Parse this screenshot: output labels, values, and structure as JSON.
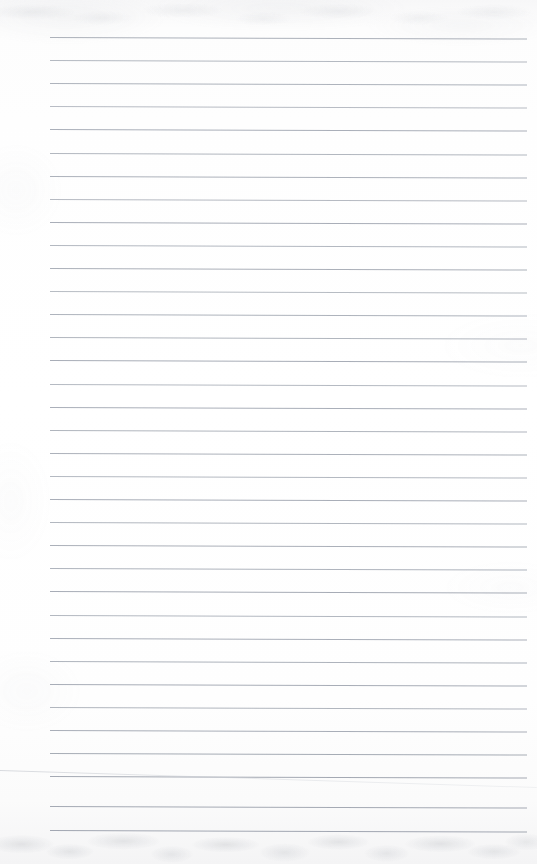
{
  "page": {
    "kind": "scanned-ruled-notebook-page",
    "width": 537,
    "height": 864,
    "has_handwriting": false,
    "has_printed_text": false,
    "visible_text": ""
  },
  "paper": {
    "background_color": "#fefefe",
    "top_tint_color": "#f7f7f8",
    "bottom_tint_color": "#f4f4f5",
    "mottle_color": "#969ba5"
  },
  "rules": {
    "line_color": "#9aa0ab",
    "line_thickness_px": 1,
    "line_count": 35,
    "first_line_y": 37,
    "spacing_px": 23.1,
    "left_x": 50,
    "right_x": 527,
    "tilt_drop_px": 1.5,
    "lines": [
      {
        "index": 1,
        "y": 37.0,
        "x1": 50,
        "x2": 527,
        "opacity": 0.82
      },
      {
        "index": 2,
        "y": 60.1,
        "x1": 50,
        "x2": 527,
        "opacity": 0.74
      },
      {
        "index": 3,
        "y": 83.2,
        "x1": 50,
        "x2": 527,
        "opacity": 0.8
      },
      {
        "index": 4,
        "y": 106.3,
        "x1": 50,
        "x2": 527,
        "opacity": 0.7
      },
      {
        "index": 5,
        "y": 129.4,
        "x1": 50,
        "x2": 527,
        "opacity": 0.84
      },
      {
        "index": 6,
        "y": 152.5,
        "x1": 50,
        "x2": 527,
        "opacity": 0.76
      },
      {
        "index": 7,
        "y": 175.6,
        "x1": 50,
        "x2": 527,
        "opacity": 0.81
      },
      {
        "index": 8,
        "y": 198.7,
        "x1": 50,
        "x2": 527,
        "opacity": 0.72
      },
      {
        "index": 9,
        "y": 221.8,
        "x1": 50,
        "x2": 527,
        "opacity": 0.85
      },
      {
        "index": 10,
        "y": 244.9,
        "x1": 50,
        "x2": 527,
        "opacity": 0.75
      },
      {
        "index": 11,
        "y": 268.0,
        "x1": 50,
        "x2": 527,
        "opacity": 0.83
      },
      {
        "index": 12,
        "y": 291.1,
        "x1": 50,
        "x2": 527,
        "opacity": 0.71
      },
      {
        "index": 13,
        "y": 314.2,
        "x1": 50,
        "x2": 527,
        "opacity": 0.8
      },
      {
        "index": 14,
        "y": 337.3,
        "x1": 50,
        "x2": 527,
        "opacity": 0.77
      },
      {
        "index": 15,
        "y": 360.4,
        "x1": 50,
        "x2": 527,
        "opacity": 0.86
      },
      {
        "index": 16,
        "y": 383.5,
        "x1": 50,
        "x2": 527,
        "opacity": 0.73
      },
      {
        "index": 17,
        "y": 406.6,
        "x1": 50,
        "x2": 527,
        "opacity": 0.84
      },
      {
        "index": 18,
        "y": 429.7,
        "x1": 50,
        "x2": 527,
        "opacity": 0.78
      },
      {
        "index": 19,
        "y": 452.8,
        "x1": 50,
        "x2": 527,
        "opacity": 0.82
      },
      {
        "index": 20,
        "y": 475.9,
        "x1": 50,
        "x2": 527,
        "opacity": 0.74
      },
      {
        "index": 21,
        "y": 499.0,
        "x1": 50,
        "x2": 527,
        "opacity": 0.85
      },
      {
        "index": 22,
        "y": 522.1,
        "x1": 50,
        "x2": 527,
        "opacity": 0.76
      },
      {
        "index": 23,
        "y": 545.2,
        "x1": 50,
        "x2": 527,
        "opacity": 0.83
      },
      {
        "index": 24,
        "y": 568.3,
        "x1": 50,
        "x2": 527,
        "opacity": 0.79
      },
      {
        "index": 25,
        "y": 591.4,
        "x1": 50,
        "x2": 527,
        "opacity": 0.87
      },
      {
        "index": 26,
        "y": 614.5,
        "x1": 50,
        "x2": 527,
        "opacity": 0.75
      },
      {
        "index": 27,
        "y": 637.6,
        "x1": 50,
        "x2": 527,
        "opacity": 0.84
      },
      {
        "index": 28,
        "y": 660.7,
        "x1": 50,
        "x2": 527,
        "opacity": 0.8
      },
      {
        "index": 29,
        "y": 683.8,
        "x1": 50,
        "x2": 527,
        "opacity": 0.86
      },
      {
        "index": 30,
        "y": 706.9,
        "x1": 50,
        "x2": 527,
        "opacity": 0.77
      },
      {
        "index": 31,
        "y": 730.0,
        "x1": 50,
        "x2": 527,
        "opacity": 0.85
      },
      {
        "index": 32,
        "y": 753.1,
        "x1": 50,
        "x2": 527,
        "opacity": 0.88
      },
      {
        "index": 33,
        "y": 776.2,
        "x1": 50,
        "x2": 527,
        "opacity": 0.9
      },
      {
        "index": 34,
        "y": 806.0,
        "x1": 50,
        "x2": 527,
        "opacity": 0.89
      },
      {
        "index": 35,
        "y": 830.0,
        "x1": 50,
        "x2": 527,
        "opacity": 0.92
      }
    ]
  },
  "artifacts": {
    "fold_line": {
      "name": "page-edge-fold",
      "x1": 0,
      "y1": 770,
      "x2": 537,
      "y2": 787,
      "color": "#c3c7ce"
    }
  }
}
